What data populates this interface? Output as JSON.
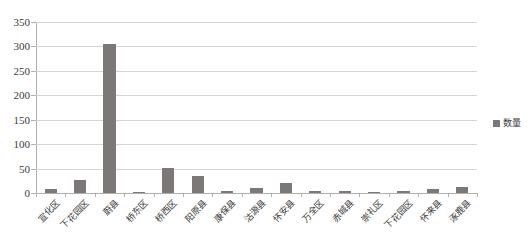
{
  "chart_data": {
    "type": "bar",
    "title": "",
    "xlabel": "",
    "ylabel": "",
    "ylim": [
      0,
      350
    ],
    "ytick_step": 50,
    "yticks": [
      350,
      300,
      250,
      200,
      150,
      100,
      50,
      0
    ],
    "grid": true,
    "legend_position": "right",
    "bar_color": "#7b7877",
    "gridline_color": "#d4d4d4",
    "axis_color": "#b0b0b0",
    "series": [
      {
        "name": "数量",
        "values": [
          8,
          27,
          305,
          2,
          51,
          35,
          4,
          11,
          20,
          5,
          5,
          1,
          4,
          9,
          12
        ]
      }
    ],
    "categories": [
      "宣化区",
      "下花园区",
      "蔚县",
      "桥东区",
      "桥西区",
      "阳原县",
      "康保县",
      "沽源县",
      "怀安县",
      "万全区",
      "赤城县",
      "崇礼区",
      "下花园区",
      "怀来县",
      "涿鹿县"
    ]
  },
  "legend": {
    "label": "数量",
    "swatch_name": "legend-color-swatch"
  }
}
